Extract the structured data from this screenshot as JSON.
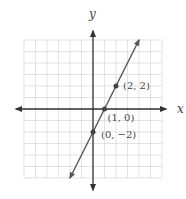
{
  "chart_data": {
    "type": "line",
    "title": "",
    "xlabel": "x",
    "ylabel": "y",
    "xlim": [
      -6,
      6
    ],
    "ylim": [
      -6,
      6
    ],
    "grid": true,
    "equation": "y = 2x - 2",
    "series": [
      {
        "name": "line",
        "x": [
          -2,
          4
        ],
        "y": [
          -6,
          6
        ]
      }
    ],
    "points": [
      {
        "x": 2,
        "y": 2,
        "label": "(2, 2)"
      },
      {
        "x": 1,
        "y": 0,
        "label": "(1, 0)"
      },
      {
        "x": 0,
        "y": -2,
        "label": "(0, −2)"
      }
    ]
  },
  "axes": {
    "x_label": "x",
    "y_label": "y"
  },
  "colors": {
    "grid": "#dcdcdc",
    "axis": "#333333",
    "line": "#555555",
    "point": "#444444"
  }
}
